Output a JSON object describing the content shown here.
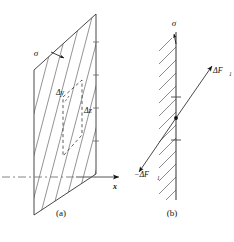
{
  "figure": {
    "background_color": "#ffffff",
    "ink_color": "#111111",
    "hatch_color": "#555555",
    "panels": [
      {
        "id": "panel-a",
        "caption": "(a)",
        "description": "Perspective view of a plane surface with hatching and a small area element",
        "labels": {
          "surface_stress": "σ",
          "element_width": "Δy",
          "element_height": "Δz",
          "axis_x": "x"
        }
      },
      {
        "id": "panel-b",
        "caption": "(b)",
        "description": "Edge-on view of the same plane with equal and opposite force increments",
        "labels": {
          "surface_stress": "σ",
          "force_positive": "ΔF",
          "force_positive_sub": "1",
          "force_negative": "−ΔF",
          "force_negative_sub": "1"
        }
      }
    ]
  }
}
